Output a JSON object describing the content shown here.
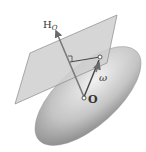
{
  "diagram": {
    "title": "",
    "labels": {
      "angular_momentum": "H",
      "angular_momentum_sub": "O",
      "angular_velocity": "ω",
      "origin": "O"
    },
    "elements": {
      "ellipsoid": "inertia-ellipsoid",
      "plane": "invariable-plane",
      "right_angle_marker": "perpendicular-marker",
      "contact_point": "contact-point"
    },
    "colors": {
      "ellipsoid_light": "#e6e6e6",
      "ellipsoid_dark": "#8c8c8c",
      "plane_fill": "#c8c8c8",
      "plane_stroke": "#8a8a8a",
      "vector": "#555555"
    }
  }
}
